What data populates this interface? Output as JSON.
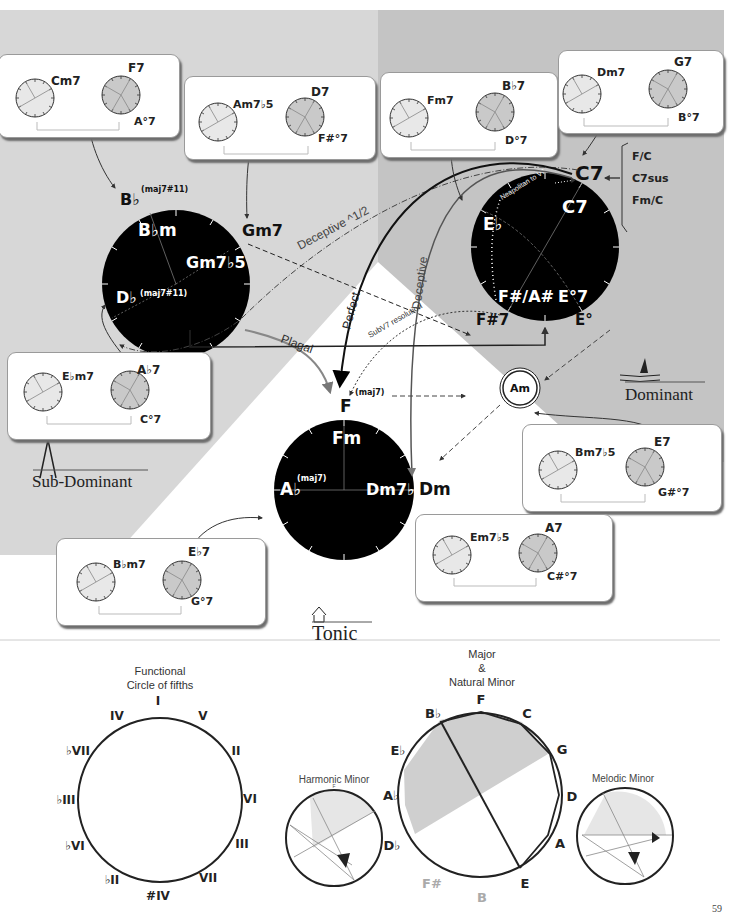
{
  "regions": {
    "sub_dominant": {
      "label": "Sub-Dominant",
      "color": "#d7d7d7"
    },
    "dominant": {
      "label": "Dominant",
      "color": "#c2c2c2"
    },
    "tonic": {
      "label": "Tonic",
      "color": "#ffffff"
    }
  },
  "main_circles": {
    "sub_dominant": {
      "outer_top": "B♭",
      "outer_top_sup": "(maj7#11)",
      "inner_top": "B♭m",
      "inner_right": "Gm7♭5",
      "outer_right": "Gm7",
      "inner_left": "D♭",
      "inner_left_sup": "(maj7#11)"
    },
    "dominant": {
      "outer_top": "C7",
      "inner_top": "C7",
      "inner_left": "E♭",
      "inner_bottom_left": "F#/A#",
      "inner_bottom_right": "E°7",
      "outer_bottom_left": "F#7",
      "outer_bottom_right": "E°",
      "arc_label": "Neapolitan to V7"
    },
    "tonic": {
      "outer_top": "F",
      "outer_top_sup": "(maj7)",
      "inner_top": "Fm",
      "inner_left": "A♭",
      "inner_left_sup": "(maj7)",
      "inner_right": "Dm7♭5",
      "outer_right": "Dm"
    }
  },
  "am_node": "Am",
  "c7_alternatives": [
    "F/C",
    "C7sus",
    "Fm/C"
  ],
  "arrows": {
    "deceptive_half": "Deceptive ^1/2",
    "perfect": "Perfect",
    "deceptive": "Deceptive",
    "plagal": "Plagal",
    "subv7": "SubV7 resolution"
  },
  "cards": [
    {
      "id": "cm7-f7",
      "left": "Cm7",
      "right_top": "F7",
      "right_bottom": "A°7"
    },
    {
      "id": "am7b5-d7",
      "left": "Am7♭5",
      "right_top": "D7",
      "right_bottom": "F#°7"
    },
    {
      "id": "fm7-bb7",
      "left": "Fm7",
      "right_top": "B♭7",
      "right_bottom": "D°7"
    },
    {
      "id": "dm7-g7",
      "left": "Dm7",
      "right_top": "G7",
      "right_bottom": "B°7"
    },
    {
      "id": "ebm7-ab7",
      "left": "E♭m7",
      "right_top": "A♭7",
      "right_bottom": "C°7"
    },
    {
      "id": "bm7b5-e7",
      "left": "Bm7♭5",
      "right_top": "E7",
      "right_bottom": "G#°7"
    },
    {
      "id": "em7b5-a7",
      "left": "Em7♭5",
      "right_top": "A7",
      "right_bottom": "C#°7"
    },
    {
      "id": "bbm7-eb7",
      "left": "B♭m7",
      "right_top": "E♭7",
      "right_bottom": "G°7"
    }
  ],
  "functional_circle": {
    "title_line1": "Functional",
    "title_line2": "Circle of fifths",
    "degrees": [
      "I",
      "V",
      "II",
      "VI",
      "III",
      "VII",
      "#IV",
      "♭II",
      "♭VI",
      "♭III",
      "♭VII",
      "IV"
    ]
  },
  "major_circle": {
    "title_line1": "Major",
    "title_line2": "&",
    "title_line3": "Natural Minor",
    "notes": [
      "F",
      "C",
      "G",
      "D",
      "A",
      "E",
      "B",
      "F#",
      "D♭",
      "A♭",
      "E♭",
      "B♭"
    ]
  },
  "harmonic_minor": {
    "title": "Harmonic Minor",
    "notes": [
      "F",
      "C",
      "G",
      "D",
      "A",
      "E",
      "B",
      "F#",
      "D♭",
      "A♭",
      "E♭",
      "B♭"
    ]
  },
  "melodic_minor": {
    "title": "Melodic Minor",
    "notes": [
      "F",
      "C",
      "G",
      "D",
      "A",
      "E",
      "B",
      "F#",
      "D♭",
      "A♭",
      "E♭",
      "B♭"
    ]
  },
  "page_number": "59"
}
